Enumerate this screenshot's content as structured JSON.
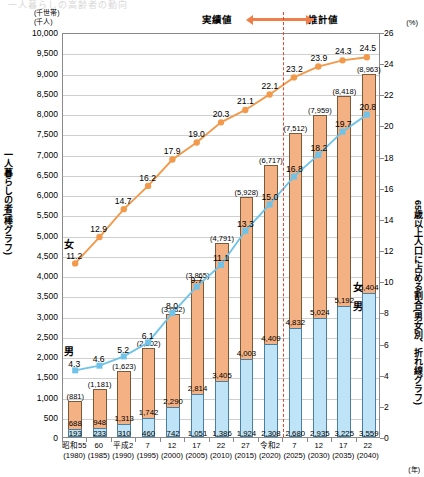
{
  "faint_title": "一人暮らしの高齢者の動向",
  "axes": {
    "left_unit_line1": "(千世帯)",
    "left_unit_line2": "(千人)",
    "right_unit": "(%)",
    "year_unit": "(年)",
    "left_title": "一人暮らしの者(棒グラフ)",
    "right_title": "65歳以上人口に占める割合(男女別、折れ線グラフ)",
    "y_left_ticks": [
      "10,000",
      "9,500",
      "9,000",
      "8,500",
      "8,000",
      "7,500",
      "7,000",
      "6,500",
      "6,000",
      "5,500",
      "5,000",
      "4,500",
      "4,000",
      "3,500",
      "3,000",
      "2,500",
      "2,000",
      "1,500",
      "1,000",
      "500",
      "0"
    ],
    "y_right_ticks": [
      "26",
      "24",
      "22",
      "20",
      "18",
      "16",
      "14",
      "12",
      "10",
      "8",
      "6",
      "4",
      "2",
      "0"
    ]
  },
  "banner": {
    "actual_label": "実績値",
    "estimate_label": "推計値"
  },
  "legend": {
    "female": "女",
    "male": "男"
  },
  "chart_data": {
    "type": "bar",
    "title": "一人暮らしの高齢者の動向",
    "xlabel": "(年)",
    "ylabel": "一人暮らしの者(棒グラフ)",
    "y2label": "65歳以上人口に占める割合(男女別、折れ線グラフ)",
    "ylim": [
      0,
      10000
    ],
    "y2lim": [
      0,
      26
    ],
    "grid": true,
    "legend_position": "inline-right",
    "categories": [
      {
        "era": "昭和55",
        "year": "(1980)"
      },
      {
        "era": "60",
        "year": "(1985)"
      },
      {
        "era": "平成2",
        "year": "(1990)"
      },
      {
        "era": "7",
        "year": "(1995)"
      },
      {
        "era": "12",
        "year": "(2000)"
      },
      {
        "era": "17",
        "year": "(2005)"
      },
      {
        "era": "22",
        "year": "(2010)"
      },
      {
        "era": "27",
        "year": "(2015)"
      },
      {
        "era": "令和2",
        "year": "(2020)"
      },
      {
        "era": "7",
        "year": "(2025)"
      },
      {
        "era": "12",
        "year": "(2030)"
      },
      {
        "era": "17",
        "year": "(2035)"
      },
      {
        "era": "22",
        "year": "(2040)"
      }
    ],
    "series": [
      {
        "name": "女",
        "type": "bar-stack-upper",
        "color": "#f4b183",
        "values": [
          688,
          948,
          1313,
          1742,
          2290,
          2814,
          3405,
          4003,
          4409,
          4832,
          5024,
          5192,
          5404
        ],
        "labels": [
          "688",
          "948",
          "1,313",
          "1,742",
          "2,290",
          "2,814",
          "3,405",
          "4,003",
          "4,409",
          "4,832",
          "5,024",
          "5,192",
          "5,404"
        ]
      },
      {
        "name": "男",
        "type": "bar-stack-lower",
        "color": "#bfe4f7",
        "values": [
          193,
          233,
          310,
          460,
          742,
          1051,
          1386,
          1924,
          2308,
          2680,
          2935,
          3225,
          3559
        ],
        "labels": [
          "193",
          "233",
          "310",
          "460",
          "742",
          "1,051",
          "1,386",
          "1,924",
          "2,308",
          "2,680",
          "2,935",
          "3,225",
          "3,559"
        ]
      },
      {
        "name": "女 (割合)",
        "type": "line",
        "color": "#f2994a",
        "values": [
          11.2,
          12.9,
          14.7,
          16.2,
          17.9,
          19.0,
          20.3,
          21.1,
          22.1,
          23.2,
          23.9,
          24.3,
          24.5
        ],
        "labels": [
          "11.2",
          "12.9",
          "14.7",
          "16.2",
          "17.9",
          "19.0",
          "20.3",
          "21.1",
          "22.1",
          "23.2",
          "23.9",
          "24.3",
          "24.5"
        ]
      },
      {
        "name": "男 (割合)",
        "type": "line",
        "color": "#6fc3e8",
        "values": [
          4.3,
          4.6,
          5.2,
          6.1,
          8.0,
          9.7,
          11.1,
          13.3,
          15.0,
          16.8,
          18.2,
          19.7,
          20.8
        ],
        "labels": [
          "4.3",
          "4.6",
          "5.2",
          "6.1",
          "8.0",
          "9.7",
          "11.1",
          "13.3",
          "15.0",
          "16.8",
          "18.2",
          "19.7",
          "20.8"
        ]
      }
    ],
    "totals": {
      "values": [
        881,
        1181,
        1623,
        2202,
        3032,
        3865,
        4791,
        5928,
        6717,
        7512,
        7959,
        8418,
        8963
      ],
      "labels": [
        "(881)",
        "(1,181)",
        "(1,623)",
        "(2,202)",
        "(3,032)",
        "(3,865)",
        "(4,791)",
        "(5,928)",
        "(6,717)",
        "(7,512)",
        "(7,959)",
        "(8,418)",
        "(8,963)"
      ]
    },
    "annotations": {
      "divider_after_index": 8,
      "divider_note_left": "実績値",
      "divider_note_right": "推計値"
    }
  }
}
